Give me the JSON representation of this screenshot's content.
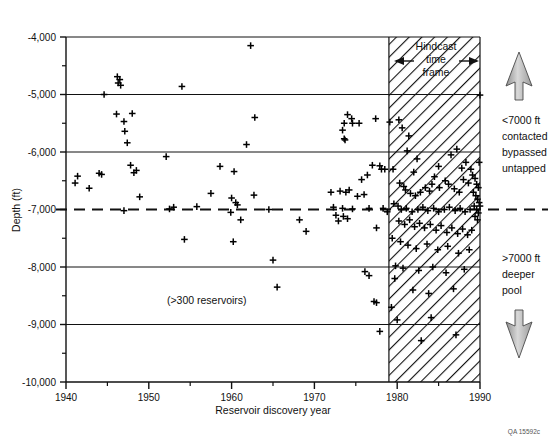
{
  "figure": {
    "credit": "QA 15592c"
  },
  "chart_data": {
    "type": "scatter",
    "title": "",
    "xlabel": "Reservoir discovery year",
    "ylabel": "Depth (ft)",
    "xlim": [
      1940,
      1990
    ],
    "ylim": [
      -10000,
      -4000
    ],
    "grid": true,
    "legend": "none",
    "x_ticks_major": [
      1940,
      1950,
      1960,
      1970,
      1980,
      1990
    ],
    "x_ticks_minor": [
      1945,
      1955,
      1965,
      1975,
      1985
    ],
    "y_ticks_major": [
      -4000,
      -5000,
      -6000,
      -7000,
      -8000,
      -9000,
      -10000
    ],
    "y_tick_labels": [
      "-4,000",
      "-5,000",
      "-6,000",
      "-7,000",
      "-8,000",
      "-9,000",
      "-10,000"
    ],
    "x_tick_labels": [
      "1940",
      "1950",
      "1960",
      "1970",
      "1980",
      "1990"
    ],
    "gridlines_y": [
      -5000,
      -6000,
      -8000,
      -9000
    ],
    "reference_line": {
      "y": -7000,
      "style": "dashed",
      "label": "-7000 ft datum"
    },
    "shaded_region": {
      "label": "Hindcast time frame",
      "label_lines": [
        "Hindcast",
        "time",
        "frame"
      ],
      "x_start": 1979,
      "x_end": 1990,
      "pattern": "diagonal-hatch"
    },
    "annotations": [
      {
        "id": "reservoir-count",
        "text": "(>300 reservoirs)",
        "x": 1957,
        "y": -8650
      },
      {
        "id": "shallow-label",
        "text_lines": [
          "<7000 ft",
          "contacted",
          "bypassed",
          "untapped"
        ],
        "arrow": "up"
      },
      {
        "id": "deep-label",
        "text_lines": [
          ">7000 ft",
          "deeper",
          "pool"
        ],
        "arrow": "down"
      }
    ],
    "marker": "plus",
    "points": [
      [
        1962.3,
        -4150
      ],
      [
        1946.2,
        -4690
      ],
      [
        1946.5,
        -4740
      ],
      [
        1946.3,
        -4800
      ],
      [
        1946.6,
        -4840
      ],
      [
        1954.0,
        -4860
      ],
      [
        1944.6,
        -5000
      ],
      [
        1990.0,
        -5010
      ],
      [
        1946.1,
        -5340
      ],
      [
        1948.0,
        -5330
      ],
      [
        1947.0,
        -5470
      ],
      [
        1947.1,
        -5640
      ],
      [
        1947.4,
        -5840
      ],
      [
        1962.8,
        -5400
      ],
      [
        1961.8,
        -5870
      ],
      [
        1974.0,
        -5350
      ],
      [
        1974.5,
        -5420
      ],
      [
        1973.6,
        -5500
      ],
      [
        1974.6,
        -5500
      ],
      [
        1975.4,
        -5500
      ],
      [
        1973.4,
        -5620
      ],
      [
        1973.6,
        -5770
      ],
      [
        1973.7,
        -5790
      ],
      [
        1977.4,
        -5420
      ],
      [
        1979.1,
        -5480
      ],
      [
        1980.2,
        -5440
      ],
      [
        1952.1,
        -6080
      ],
      [
        1947.8,
        -6230
      ],
      [
        1948.5,
        -6320
      ],
      [
        1948.2,
        -6360
      ],
      [
        1941.4,
        -6420
      ],
      [
        1944.0,
        -6370
      ],
      [
        1944.3,
        -6390
      ],
      [
        1958.6,
        -6250
      ],
      [
        1960.3,
        -6340
      ],
      [
        1977.0,
        -6230
      ],
      [
        1977.9,
        -6240
      ],
      [
        1978.1,
        -6300
      ],
      [
        1978.5,
        -6300
      ],
      [
        1941.1,
        -6540
      ],
      [
        1942.8,
        -6630
      ],
      [
        1948.9,
        -6780
      ],
      [
        1947.0,
        -7020
      ],
      [
        1952.5,
        -6990
      ],
      [
        1953.0,
        -6960
      ],
      [
        1957.5,
        -6720
      ],
      [
        1960.0,
        -6800
      ],
      [
        1960.5,
        -6880
      ],
      [
        1960.7,
        -6920
      ],
      [
        1959.9,
        -7050
      ],
      [
        1961.1,
        -7180
      ],
      [
        1962.7,
        -6750
      ],
      [
        1955.8,
        -6950
      ],
      [
        1964.5,
        -7000
      ],
      [
        1972.0,
        -6700
      ],
      [
        1973.1,
        -6680
      ],
      [
        1973.8,
        -6700
      ],
      [
        1974.2,
        -6660
      ],
      [
        1975.2,
        -6770
      ],
      [
        1976.0,
        -6740
      ],
      [
        1972.3,
        -6960
      ],
      [
        1973.4,
        -6980
      ],
      [
        1974.6,
        -6990
      ],
      [
        1976.6,
        -6980
      ],
      [
        1972.6,
        -7100
      ],
      [
        1973.5,
        -7120
      ],
      [
        1974.0,
        -7160
      ],
      [
        1972.9,
        -7200
      ],
      [
        1977.5,
        -7320
      ],
      [
        1969.0,
        -7380
      ],
      [
        1968.2,
        -7180
      ],
      [
        1965.0,
        -7880
      ],
      [
        1960.2,
        -7560
      ],
      [
        1954.3,
        -7520
      ],
      [
        1965.5,
        -8350
      ],
      [
        1976.1,
        -8080
      ],
      [
        1976.6,
        -8150
      ],
      [
        1977.2,
        -8600
      ],
      [
        1977.5,
        -8620
      ],
      [
        1977.9,
        -9120
      ],
      [
        1980.6,
        -5580
      ],
      [
        1981.4,
        -5720
      ],
      [
        1981.2,
        -5980
      ],
      [
        1982.4,
        -6120
      ],
      [
        1982.0,
        -6350
      ],
      [
        1984.5,
        -6430
      ],
      [
        1985.0,
        -6250
      ],
      [
        1986.5,
        -6050
      ],
      [
        1987.2,
        -5950
      ],
      [
        1987.8,
        -6280
      ],
      [
        1988.3,
        -6180
      ],
      [
        1980.3,
        -6540
      ],
      [
        1980.8,
        -6600
      ],
      [
        1981.0,
        -6660
      ],
      [
        1981.6,
        -6720
      ],
      [
        1982.2,
        -6760
      ],
      [
        1982.8,
        -6700
      ],
      [
        1983.4,
        -6620
      ],
      [
        1983.9,
        -6680
      ],
      [
        1984.2,
        -6560
      ],
      [
        1985.1,
        -6620
      ],
      [
        1985.8,
        -6500
      ],
      [
        1986.2,
        -6560
      ],
      [
        1986.9,
        -6640
      ],
      [
        1987.5,
        -6700
      ],
      [
        1988.0,
        -6480
      ],
      [
        1988.6,
        -6540
      ],
      [
        1989.1,
        -6400
      ],
      [
        1989.4,
        -6460
      ],
      [
        1989.6,
        -6560
      ],
      [
        1989.8,
        -6620
      ],
      [
        1989.2,
        -6700
      ],
      [
        1989.5,
        -6760
      ],
      [
        1989.7,
        -6820
      ],
      [
        1989.9,
        -6880
      ],
      [
        1989.3,
        -6940
      ],
      [
        1989.6,
        -7000
      ],
      [
        1989.8,
        -7060
      ],
      [
        1990.0,
        -6940
      ],
      [
        1989.4,
        -7120
      ],
      [
        1989.7,
        -7180
      ],
      [
        1980.1,
        -6940
      ],
      [
        1980.5,
        -7000
      ],
      [
        1981.1,
        -6980
      ],
      [
        1981.8,
        -7040
      ],
      [
        1982.5,
        -7000
      ],
      [
        1983.1,
        -6960
      ],
      [
        1983.7,
        -7020
      ],
      [
        1984.4,
        -6980
      ],
      [
        1985.0,
        -7040
      ],
      [
        1985.7,
        -7000
      ],
      [
        1986.3,
        -6960
      ],
      [
        1987.0,
        -7020
      ],
      [
        1987.6,
        -6980
      ],
      [
        1988.2,
        -7040
      ],
      [
        1988.8,
        -7000
      ],
      [
        1980.2,
        -7200
      ],
      [
        1980.9,
        -7260
      ],
      [
        1981.5,
        -7180
      ],
      [
        1982.1,
        -7300
      ],
      [
        1982.7,
        -7240
      ],
      [
        1983.3,
        -7320
      ],
      [
        1984.0,
        -7260
      ],
      [
        1984.7,
        -7360
      ],
      [
        1985.3,
        -7280
      ],
      [
        1986.0,
        -7400
      ],
      [
        1986.6,
        -7320
      ],
      [
        1987.3,
        -7420
      ],
      [
        1987.9,
        -7340
      ],
      [
        1988.5,
        -7440
      ],
      [
        1989.0,
        -7360
      ],
      [
        1980.4,
        -7560
      ],
      [
        1981.3,
        -7620
      ],
      [
        1982.3,
        -7680
      ],
      [
        1983.6,
        -7600
      ],
      [
        1984.9,
        -7700
      ],
      [
        1986.1,
        -7640
      ],
      [
        1987.4,
        -7760
      ],
      [
        1988.7,
        -7700
      ],
      [
        1979.8,
        -7980
      ],
      [
        1980.7,
        -8020
      ],
      [
        1982.6,
        -8060
      ],
      [
        1984.3,
        -8000
      ],
      [
        1985.9,
        -8100
      ],
      [
        1988.1,
        -8040
      ],
      [
        1981.9,
        -8400
      ],
      [
        1983.8,
        -8460
      ],
      [
        1986.8,
        -8380
      ],
      [
        1980.0,
        -8920
      ],
      [
        1984.1,
        -8880
      ],
      [
        1982.9,
        -9280
      ],
      [
        1987.1,
        -9180
      ],
      [
        1979.5,
        -6300
      ],
      [
        1979.6,
        -6900
      ],
      [
        1979.4,
        -7500
      ],
      [
        1979.7,
        -8200
      ],
      [
        1979.3,
        -8700
      ],
      [
        1988.9,
        -6300
      ],
      [
        1989.9,
        -6180
      ],
      [
        1978.3,
        -6980
      ],
      [
        1978.8,
        -7040
      ],
      [
        1976.4,
        -6400
      ],
      [
        1975.7,
        -6480
      ]
    ]
  }
}
